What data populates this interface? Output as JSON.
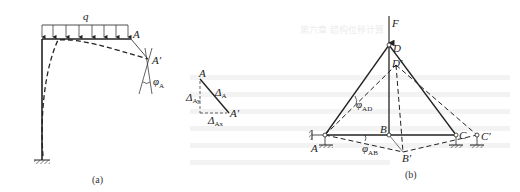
{
  "figure_a": {
    "caption": "(a)",
    "load_label": "q",
    "point_A": "A",
    "point_A_prime": "A′",
    "rotation_label": "φ",
    "rotation_sub": "A",
    "triangle": {
      "top": "A",
      "bottom": "A′",
      "hyp": "Δ",
      "hyp_sub": "A",
      "vert": "Δ",
      "vert_sub": "Ay",
      "horiz": "Δ",
      "horiz_sub": "Ax"
    }
  },
  "figure_b": {
    "caption": "(b)",
    "force_label": "F",
    "nodes": {
      "A": "A",
      "B": "B",
      "C": "C",
      "D": "D",
      "B_prime": "B′",
      "C_prime": "C′",
      "D_prime": "D′"
    },
    "angle_AD": "φ",
    "angle_AD_sub": "AD",
    "angle_AB": "φ",
    "angle_AB_sub": "AB"
  },
  "background_text": {
    "heading": "第六章  结构位移计算"
  }
}
